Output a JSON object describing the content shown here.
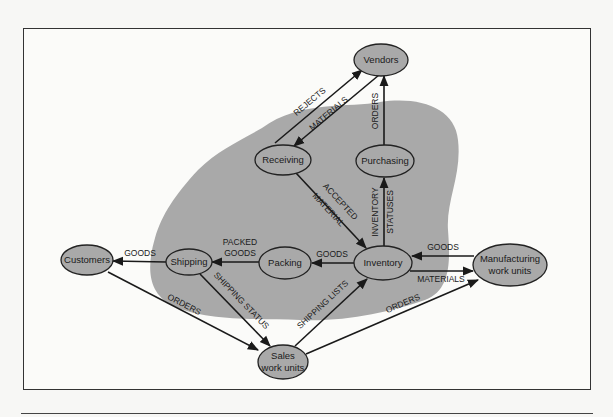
{
  "diagram": {
    "type": "data-flow",
    "region_fill": "#a9a9a9",
    "nodes": {
      "vendors": {
        "label": [
          "Vendors"
        ]
      },
      "receiving": {
        "label": [
          "Receiving"
        ]
      },
      "purchasing": {
        "label": [
          "Purchasing"
        ]
      },
      "customers": {
        "label": [
          "Customers"
        ]
      },
      "shipping": {
        "label": [
          "Shipping"
        ]
      },
      "packing": {
        "label": [
          "Packing"
        ]
      },
      "inventory": {
        "label": [
          "Inventory"
        ]
      },
      "manufacturing": {
        "label": [
          "Manufacturing",
          "work units"
        ]
      },
      "sales": {
        "label": [
          "Sales",
          "work units"
        ]
      }
    },
    "edges": {
      "rejects": {
        "from": "Receiving",
        "to": "Vendors",
        "label": [
          "REJECTS"
        ]
      },
      "materials_vendor": {
        "from": "Vendors",
        "to": "Receiving",
        "label": [
          "MATERIALS"
        ]
      },
      "orders_purchasing": {
        "from": "Purchasing",
        "to": "Vendors",
        "label": [
          "ORDERS"
        ]
      },
      "accepted_material": {
        "from": "Receiving",
        "to": "Inventory",
        "label": [
          "ACCEPTED",
          "MATERIAL"
        ]
      },
      "inventory_statuses": {
        "from": "Inventory",
        "to": "Purchasing",
        "label": [
          "INVENTORY",
          "STATUSES"
        ]
      },
      "goods_inv_pack": {
        "from": "Inventory",
        "to": "Packing",
        "label": [
          "GOODS"
        ]
      },
      "packed_goods": {
        "from": "Packing",
        "to": "Shipping",
        "label": [
          "PACKED",
          "GOODS"
        ]
      },
      "goods_ship_cust": {
        "from": "Shipping",
        "to": "Customers",
        "label": [
          "GOODS"
        ]
      },
      "goods_mfg_inv": {
        "from": "Manufacturing work units",
        "to": "Inventory",
        "label": [
          "GOODS"
        ]
      },
      "materials_inv_mfg": {
        "from": "Inventory",
        "to": "Manufacturing work units",
        "label": [
          "MATERIALS"
        ]
      },
      "orders_cust_sales": {
        "from": "Customers",
        "to": "Sales work units",
        "label": [
          "ORDERS"
        ]
      },
      "shipping_status": {
        "from": "Shipping",
        "to": "Sales work units",
        "label": [
          "SHIPPING STATUS"
        ]
      },
      "shipping_lists": {
        "from": "Sales work units",
        "to": "Inventory",
        "label": [
          "SHIPPING LISTS"
        ]
      },
      "orders_sales_mfg": {
        "from": "Sales work units",
        "to": "Manufacturing work units",
        "label": [
          "ORDERS"
        ]
      }
    }
  },
  "t": {
    "vendors": "Vendors",
    "receiving": "Receiving",
    "purchasing": "Purchasing",
    "customers": "Customers",
    "shipping": "Shipping",
    "packing": "Packing",
    "inventory": "Inventory",
    "manufacturing_1": "Manufacturing",
    "manufacturing_2": "work units",
    "sales_1": "Sales",
    "sales_2": "work units",
    "rejects": "REJECTS",
    "materials_vendor": "MATERIALS",
    "orders_purchasing": "ORDERS",
    "accepted_1": "ACCEPTED",
    "accepted_2": "MATERIAL",
    "inv_status_1": "INVENTORY",
    "inv_status_2": "STATUSES",
    "goods_inv_pack": "GOODS",
    "packed_1": "PACKED",
    "packed_2": "GOODS",
    "goods_ship_cust": "GOODS",
    "goods_mfg_inv": "GOODS",
    "materials_inv_mfg": "MATERIALS",
    "orders_cust_sales": "ORDERS",
    "shipping_status": "SHIPPING STATUS",
    "shipping_lists": "SHIPPING LISTS",
    "orders_sales_mfg": "ORDERS"
  }
}
